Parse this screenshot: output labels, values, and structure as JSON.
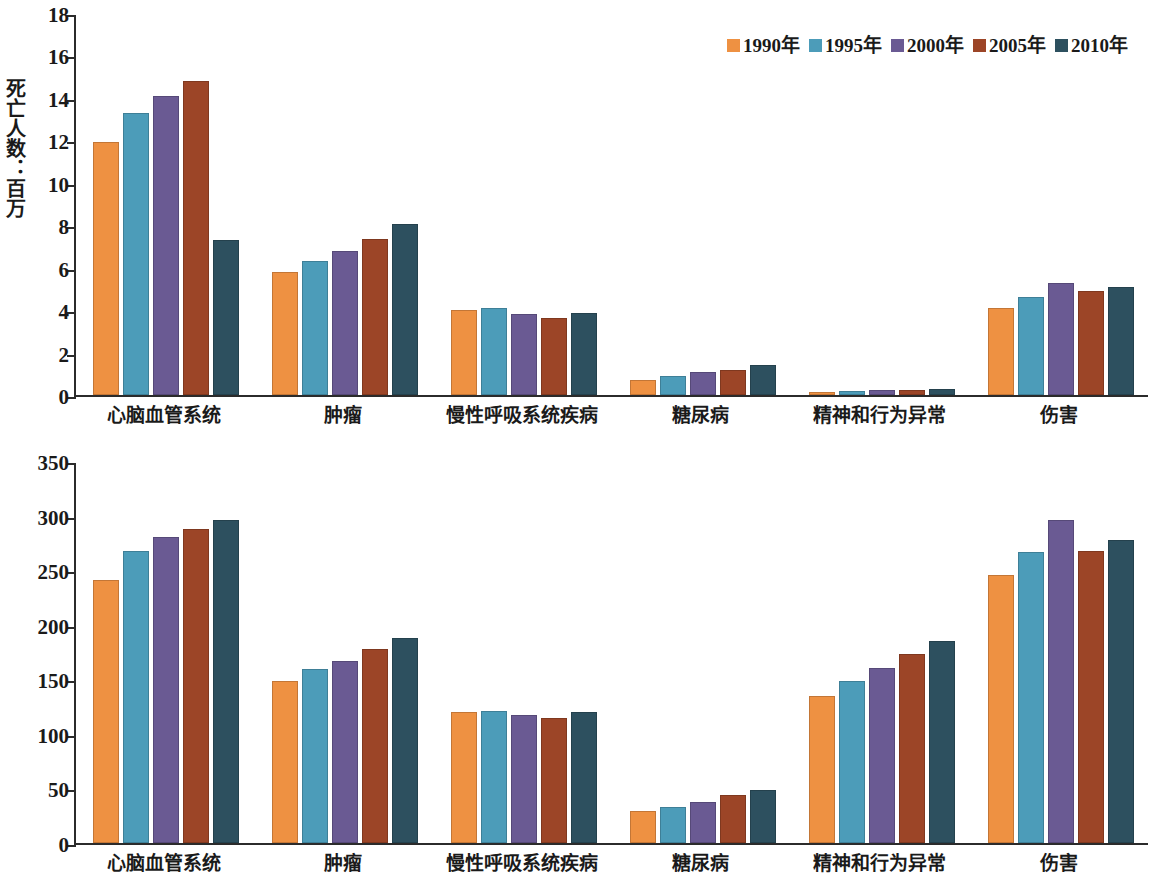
{
  "charts": {
    "top": {
      "ylabel": "死亡人数：百万",
      "legend_labels": [
        "1990年",
        "1995年",
        "2000年",
        "2005年",
        "2010年"
      ]
    },
    "bottom": {
      "ylabel": "伤残调整寿命年：百万",
      "legend_labels": [
        "1990年",
        "1995年",
        "2000年",
        "2005年",
        "2010年"
      ]
    }
  },
  "colors": {
    "series_1990": "#EE9142",
    "series_1995": "#4C9CB9",
    "series_2000": "#6A5A93",
    "series_2005": "#9C4527",
    "series_2010": "#2D505F",
    "axis": "#2b2b2b"
  },
  "chart_data": [
    {
      "type": "bar",
      "title": "",
      "subtitle": "",
      "xlabel": "",
      "ylabel": "死亡人数：百万",
      "ylim": [
        0,
        18
      ],
      "yticks": [
        0,
        2,
        4,
        6,
        8,
        10,
        12,
        14,
        16,
        18
      ],
      "grid": false,
      "legend_position": "top-right",
      "categories": [
        "心脑血管系统",
        "肿瘤",
        "慢性呼吸系统疾病",
        "糖尿病",
        "精神和行为异常",
        "伤害"
      ],
      "series": [
        {
          "name": "1990年",
          "color": "#EE9142",
          "values": [
            11.9,
            5.8,
            4.0,
            0.7,
            0.15,
            4.1
          ]
        },
        {
          "name": "1995年",
          "color": "#4C9CB9",
          "values": [
            13.3,
            6.3,
            4.1,
            0.9,
            0.2,
            4.6
          ]
        },
        {
          "name": "2000年",
          "color": "#6A5A93",
          "values": [
            14.1,
            6.8,
            3.8,
            1.1,
            0.22,
            5.3
          ]
        },
        {
          "name": "2005年",
          "color": "#9C4527",
          "values": [
            14.8,
            7.35,
            3.65,
            1.2,
            0.25,
            4.9
          ]
        },
        {
          "name": "2010年",
          "color": "#2D505F",
          "values": [
            7.3,
            8.05,
            3.85,
            1.4,
            0.3,
            5.1
          ]
        }
      ]
    },
    {
      "type": "bar",
      "title": "",
      "subtitle": "",
      "xlabel": "",
      "ylabel": "伤残调整寿命年：百万",
      "ylim": [
        0,
        350
      ],
      "yticks": [
        0,
        50,
        100,
        150,
        200,
        250,
        300,
        350
      ],
      "grid": false,
      "legend_position": "top-right",
      "categories": [
        "心脑血管系统",
        "肿瘤",
        "慢性呼吸系统疾病",
        "糖尿病",
        "精神和行为异常",
        "伤害"
      ],
      "series": [
        {
          "name": "1990年",
          "color": "#EE9142",
          "values": [
            241,
            148,
            120,
            29,
            135,
            246
          ]
        },
        {
          "name": "1995年",
          "color": "#4C9CB9",
          "values": [
            268,
            159,
            121,
            33,
            148,
            267
          ]
        },
        {
          "name": "2000年",
          "color": "#6A5A93",
          "values": [
            280,
            167,
            117,
            38,
            160,
            296
          ]
        },
        {
          "name": "2005年",
          "color": "#9C4527",
          "values": [
            288,
            178,
            115,
            44,
            173,
            268
          ]
        },
        {
          "name": "2010年",
          "color": "#2D505F",
          "values": [
            296,
            188,
            120,
            49,
            185,
            278
          ]
        }
      ]
    }
  ]
}
